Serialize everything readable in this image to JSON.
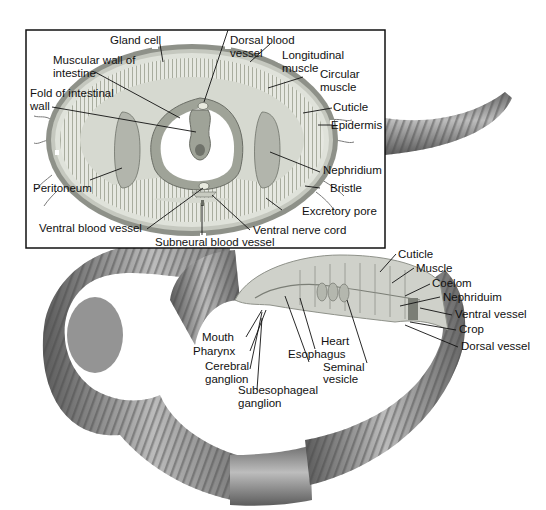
{
  "figure": {
    "inset_title": "Cross section",
    "cross_section_labels": {
      "gland_cell": "Gland cell",
      "muscular_wall_1": "Muscular wall of",
      "muscular_wall_2": "intestine",
      "fold_1": "Fold of intestinal",
      "fold_2": "wall",
      "dorsal_blood_1": "Dorsal blood",
      "dorsal_blood_2": "vessel",
      "longitudinal_1": "Longitudinal",
      "longitudinal_2": "muscle",
      "circular_1": "Circular",
      "circular_2": "muscle",
      "cuticle": "Cuticle",
      "epidermis": "Epidermis",
      "nephridium": "Nephridium",
      "bristle": "Bristle",
      "excretory_pore": "Excretory pore",
      "peritoneum": "Peritoneum",
      "ventral_blood_vessel": "Ventral blood vessel",
      "ventral_nerve_cord": "Ventral nerve cord",
      "subneural_blood_vessel": "Subneural blood vessel"
    },
    "body_labels": {
      "cuticle": "Cuticle",
      "muscle": "Muscle",
      "coelom": "Coelom",
      "nephriduim": "Nephriduim",
      "ventral_vessel": "Ventral vessel",
      "crop": "Crop",
      "dorsal_vessel": "Dorsal vessel",
      "mouth": "Mouth",
      "pharynx": "Pharynx",
      "cerebral_1": "Cerebral",
      "cerebral_2": "ganglion",
      "subesophageal_1": "Subesophageal",
      "subesophageal_2": "ganglion",
      "heart": "Heart",
      "esophagus": "Esophagus",
      "seminal_1": "Seminal",
      "seminal_2": "vesicle"
    },
    "colors": {
      "worm_dark": "#5a5a5a",
      "worm_mid": "#8c8c8c",
      "worm_light": "#c9c9c9",
      "tissue": "#b9bdb3",
      "tissue_light": "#dfe2da",
      "cavity": "#ffffff"
    }
  }
}
